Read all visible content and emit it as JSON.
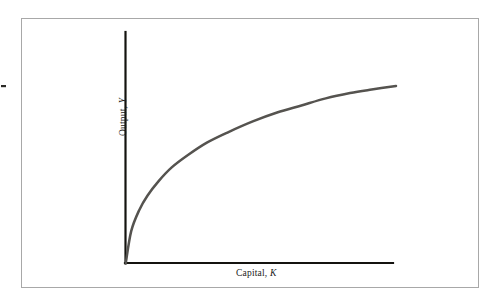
{
  "figure": {
    "background_color": "#ffffff",
    "frame_border_color": "#a8a8a8",
    "axis_color": "#14130f",
    "curve_color": "#55534f"
  },
  "axes": {
    "x_label_text": "Capital, ",
    "x_label_variable": "K",
    "y_label_text": "Output, ",
    "y_label_variable": "Y"
  },
  "chart_data": {
    "type": "line",
    "title": "",
    "subtitle": "",
    "xlabel": "Capital, K",
    "ylabel": "Output, Y",
    "grid": false,
    "legend": false,
    "legend_position": "none",
    "xlim": [
      0,
      1
    ],
    "ylim": [
      0,
      1
    ],
    "x_tick_labels": [],
    "y_tick_labels": [],
    "annotations": [],
    "series": [
      {
        "name": "Production function",
        "description": "Concave increasing production function, output rises with capital at a diminishing rate",
        "x": [
          0.0,
          0.02,
          0.05,
          0.08,
          0.12,
          0.17,
          0.23,
          0.3,
          0.38,
          0.47,
          0.56,
          0.65,
          0.74,
          0.83,
          0.91,
          1.0
        ],
        "y": [
          0.0,
          0.18,
          0.3,
          0.38,
          0.46,
          0.54,
          0.61,
          0.68,
          0.74,
          0.8,
          0.85,
          0.89,
          0.93,
          0.96,
          0.98,
          1.0
        ]
      }
    ]
  }
}
